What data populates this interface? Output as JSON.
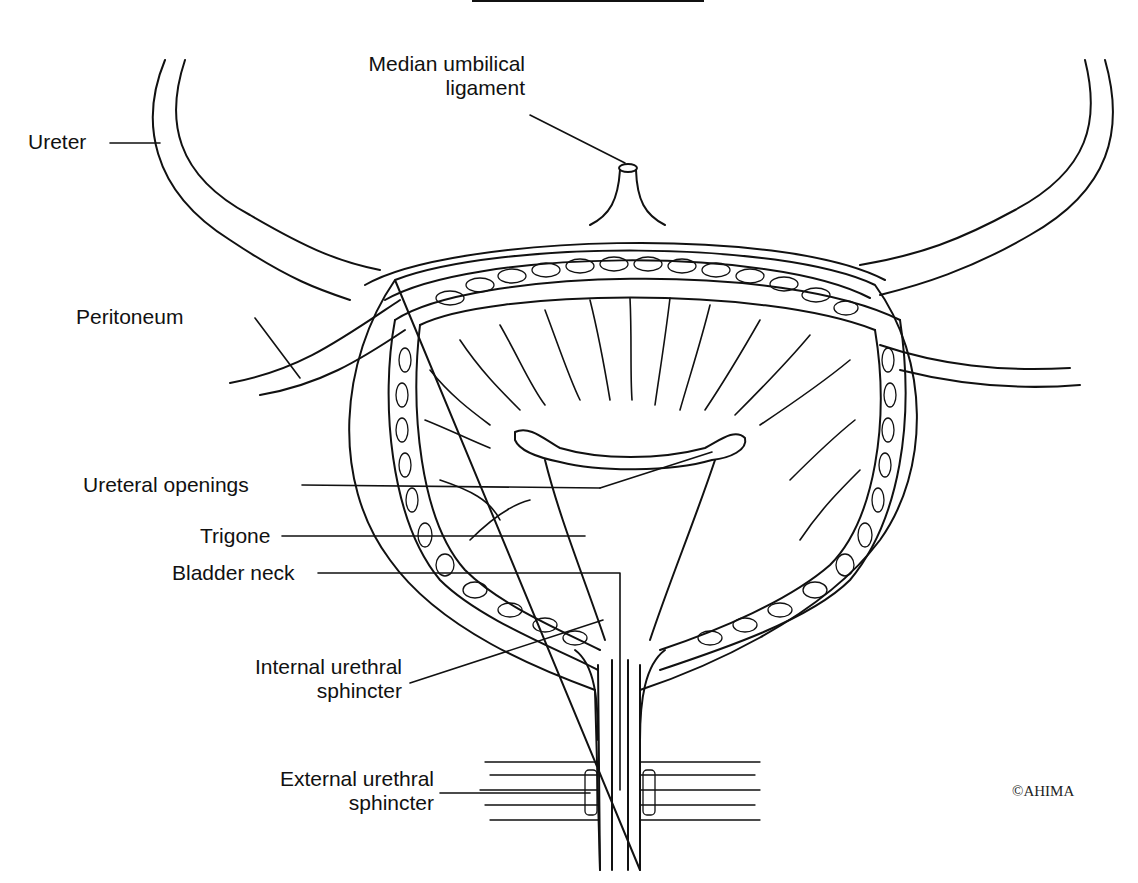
{
  "figure": {
    "copyright": "©AHIMA",
    "colors": {
      "ink": "#111111",
      "background": "#ffffff"
    }
  },
  "labels": {
    "median_umbilical_ligament": {
      "line1": "Median umbilical",
      "line2": "ligament"
    },
    "ureter": "Ureter",
    "peritoneum": "Peritoneum",
    "ureteral_openings": "Ureteral openings",
    "trigone": "Trigone",
    "bladder_neck": "Bladder neck",
    "internal_urethral_sphincter": {
      "line1": "Internal urethral",
      "line2": "sphincter"
    },
    "external_urethral_sphincter": {
      "line1": "External urethral",
      "line2": "sphincter"
    }
  }
}
